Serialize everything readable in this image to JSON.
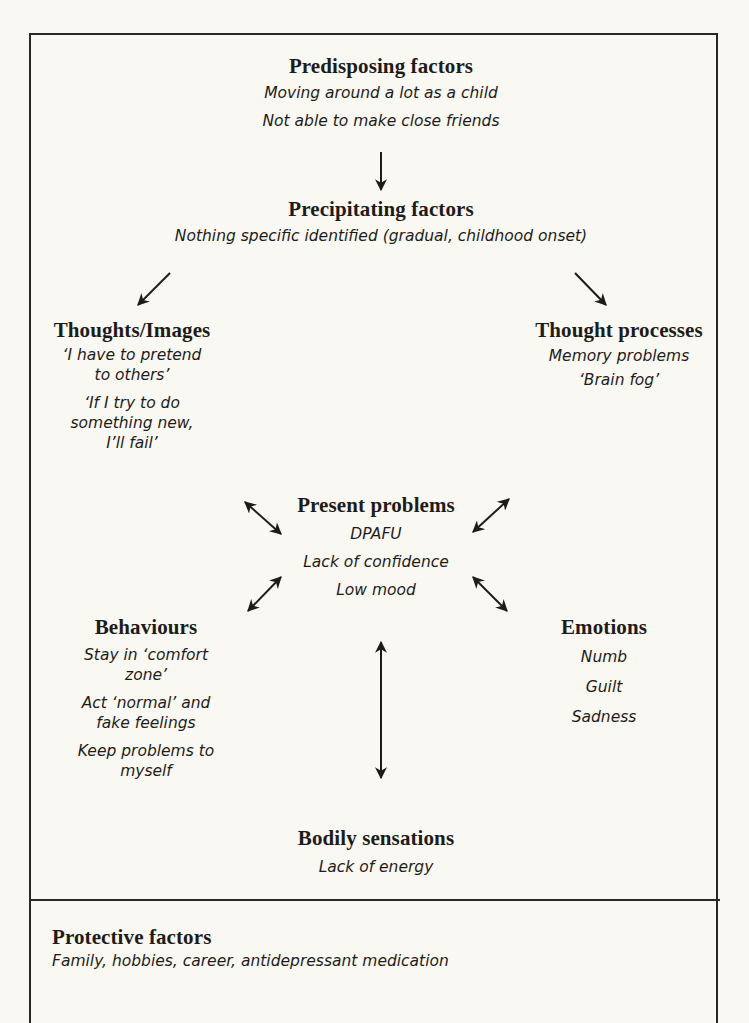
{
  "diagram": {
    "predisposing": {
      "title": "Predisposing factors",
      "items": [
        "Moving around a lot as a child",
        "Not able to make close friends"
      ]
    },
    "precipitating": {
      "title": "Precipitating factors",
      "items": [
        "Nothing specific identified (gradual, childhood onset)"
      ]
    },
    "thoughts_images": {
      "title": "Thoughts/Images",
      "items": [
        {
          "line1": "‘I have to pretend",
          "line2": "to others’"
        },
        {
          "line1": "‘If I try to do",
          "line2": "something new,",
          "line3": "I’ll fail’"
        }
      ]
    },
    "thought_processes": {
      "title": "Thought processes",
      "items": [
        "Memory problems",
        "‘Brain fog’"
      ]
    },
    "present_problems": {
      "title": "Present problems",
      "items": [
        "DPAFU",
        "Lack of confidence",
        "Low mood"
      ]
    },
    "behaviours": {
      "title": "Behaviours",
      "items": [
        {
          "line1": "Stay in ‘comfort",
          "line2": "zone’"
        },
        {
          "line1": "Act ‘normal’ and",
          "line2": "fake feelings"
        },
        {
          "line1": "Keep problems to",
          "line2": "myself"
        }
      ]
    },
    "emotions": {
      "title": "Emotions",
      "items": [
        "Numb",
        "Guilt",
        "Sadness"
      ]
    },
    "bodily_sensations": {
      "title": "Bodily sensations",
      "items": [
        "Lack of energy"
      ]
    },
    "protective": {
      "title": "Protective factors",
      "items": [
        "Family, hobbies, career, antidepressant medication"
      ]
    },
    "colors": {
      "background": "#faf8f2",
      "ink": "#1e1c1a",
      "border": "#2a2826"
    }
  }
}
